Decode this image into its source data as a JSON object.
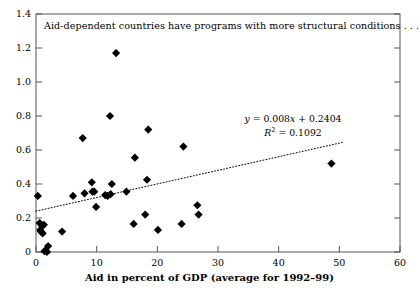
{
  "chart_data": {
    "type": "scatter",
    "title": "Aid-dependent countries have programs with more structural conditions . . .",
    "xlabel": "Aid in percent of GDP (average for 1992–99)",
    "ylabel": "",
    "xlim": [
      0,
      60
    ],
    "ylim": [
      0,
      1.4
    ],
    "grid": false,
    "legend": null,
    "xticks": [
      "0",
      "10",
      "20",
      "30",
      "40",
      "50",
      "60"
    ],
    "xtick_values": [
      0,
      10,
      20,
      30,
      40,
      50,
      60
    ],
    "yticks": [
      "0",
      "0.2",
      "0.4",
      "0.6",
      "0.8",
      "1.0",
      "1.2",
      "1.4"
    ],
    "ytick_values": [
      0,
      0.2,
      0.4,
      0.6,
      0.8,
      1.0,
      1.2,
      1.4
    ],
    "marker": "diamond",
    "marker_color": "#000000",
    "points": [
      {
        "x": 0.3,
        "y": 0.33
      },
      {
        "x": 0.6,
        "y": 0.17
      },
      {
        "x": 0.7,
        "y": 0.13
      },
      {
        "x": 0.8,
        "y": 0.12
      },
      {
        "x": 1.0,
        "y": 0.155
      },
      {
        "x": 1.1,
        "y": 0.11
      },
      {
        "x": 1.3,
        "y": 0.16
      },
      {
        "x": 1.4,
        "y": 0.005
      },
      {
        "x": 1.6,
        "y": 0.01
      },
      {
        "x": 1.8,
        "y": 0.0
      },
      {
        "x": 2.0,
        "y": 0.035
      },
      {
        "x": 4.3,
        "y": 0.12
      },
      {
        "x": 6.1,
        "y": 0.33
      },
      {
        "x": 7.7,
        "y": 0.67
      },
      {
        "x": 8.0,
        "y": 0.345
      },
      {
        "x": 9.2,
        "y": 0.41
      },
      {
        "x": 9.3,
        "y": 0.355
      },
      {
        "x": 9.6,
        "y": 0.355
      },
      {
        "x": 9.9,
        "y": 0.265
      },
      {
        "x": 11.4,
        "y": 0.335
      },
      {
        "x": 11.8,
        "y": 0.33
      },
      {
        "x": 12.2,
        "y": 0.8
      },
      {
        "x": 12.3,
        "y": 0.34
      },
      {
        "x": 12.5,
        "y": 0.4
      },
      {
        "x": 13.2,
        "y": 1.17
      },
      {
        "x": 14.9,
        "y": 0.355
      },
      {
        "x": 16.1,
        "y": 0.165
      },
      {
        "x": 16.3,
        "y": 0.555
      },
      {
        "x": 18.0,
        "y": 0.22
      },
      {
        "x": 18.3,
        "y": 0.425
      },
      {
        "x": 18.5,
        "y": 0.72
      },
      {
        "x": 20.1,
        "y": 0.13
      },
      {
        "x": 24.0,
        "y": 0.165
      },
      {
        "x": 24.3,
        "y": 0.62
      },
      {
        "x": 26.6,
        "y": 0.275
      },
      {
        "x": 26.8,
        "y": 0.22
      },
      {
        "x": 48.7,
        "y": 0.52
      }
    ],
    "trendline": {
      "style": "dotted",
      "color": "#000000",
      "slope": 0.008,
      "intercept": 0.2404,
      "x_start": 0,
      "x_end": 50.5,
      "equation": "y = 0.008x + 0.2404",
      "r_squared_label": "R",
      "r_squared_sup": "2",
      "r_squared_value": "= 0.1092"
    },
    "annotation_lines": [
      "y = 0.008x + 0.2404",
      "R2 = 0.1092"
    ]
  }
}
